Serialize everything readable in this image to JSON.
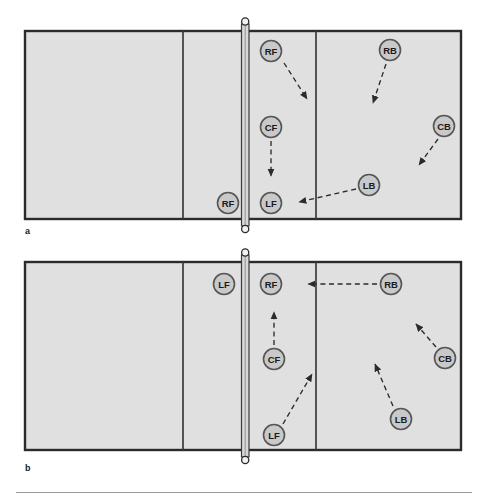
{
  "figure": {
    "title": "",
    "panels": [
      {
        "id": "a",
        "label": "a",
        "label_x": 25,
        "label_y": 226,
        "court": {
          "x": 25,
          "y": 31,
          "w": 436,
          "h": 188
        },
        "attack_lines": [
          183,
          316
        ],
        "net": {
          "x": 245,
          "top": 21,
          "bottom": 229
        },
        "players": [
          {
            "id": "a-rf-left",
            "label": "RF",
            "x": 228,
            "y": 203,
            "side": "left"
          },
          {
            "id": "a-rf-right",
            "label": "RF",
            "x": 271,
            "y": 51,
            "side": "right"
          },
          {
            "id": "a-cf",
            "label": "CF",
            "x": 271,
            "y": 127,
            "side": "right"
          },
          {
            "id": "a-lf",
            "label": "LF",
            "x": 271,
            "y": 203,
            "side": "right"
          },
          {
            "id": "a-rb",
            "label": "RB",
            "x": 390,
            "y": 50,
            "side": "right"
          },
          {
            "id": "a-cb",
            "label": "CB",
            "x": 444,
            "y": 126,
            "side": "right"
          },
          {
            "id": "a-lb",
            "label": "LB",
            "x": 369,
            "y": 185,
            "side": "right"
          }
        ],
        "arrows": [
          {
            "id": "a-arrow-rf",
            "from": "RF",
            "to": "",
            "x1": 284,
            "y1": 63,
            "x2": 309,
            "y2": 101
          },
          {
            "id": "a-arrow-cf",
            "from": "CF",
            "to": "",
            "x1": 271,
            "y1": 141,
            "x2": 271,
            "y2": 177
          },
          {
            "id": "a-arrow-rb",
            "from": "RB",
            "to": "",
            "x1": 386,
            "y1": 64,
            "x2": 372,
            "y2": 105
          },
          {
            "id": "a-arrow-cb",
            "from": "CB",
            "to": "",
            "x1": 438,
            "y1": 139,
            "x2": 417,
            "y2": 167
          },
          {
            "id": "a-arrow-lb",
            "from": "LB",
            "to": "",
            "x1": 356,
            "y1": 189,
            "x2": 297,
            "y2": 202
          }
        ]
      },
      {
        "id": "b",
        "label": "b",
        "label_x": 25,
        "label_y": 470,
        "court": {
          "x": 25,
          "y": 262,
          "w": 436,
          "h": 188
        },
        "attack_lines": [
          183,
          316
        ],
        "net": {
          "x": 245,
          "top": 252,
          "bottom": 460
        },
        "players": [
          {
            "id": "b-lf-left",
            "label": "LF",
            "x": 224,
            "y": 284,
            "side": "left"
          },
          {
            "id": "b-rf",
            "label": "RF",
            "x": 271,
            "y": 284,
            "side": "right"
          },
          {
            "id": "b-cf",
            "label": "CF",
            "x": 274,
            "y": 359,
            "side": "right"
          },
          {
            "id": "b-lf-right",
            "label": "LF",
            "x": 274,
            "y": 435,
            "side": "right"
          },
          {
            "id": "b-rb",
            "label": "RB",
            "x": 391,
            "y": 284,
            "side": "right"
          },
          {
            "id": "b-cb",
            "label": "CB",
            "x": 445,
            "y": 358,
            "side": "right"
          },
          {
            "id": "b-lb",
            "label": "LB",
            "x": 401,
            "y": 419,
            "side": "right"
          }
        ],
        "arrows": [
          {
            "id": "b-arrow-rb",
            "from": "RB",
            "to": "RF",
            "x1": 377,
            "y1": 284,
            "x2": 306,
            "y2": 284
          },
          {
            "id": "b-arrow-cf",
            "from": "CF",
            "to": "RF",
            "x1": 274,
            "y1": 345,
            "x2": 274,
            "y2": 310
          },
          {
            "id": "b-arrow-lf",
            "from": "LF",
            "to": "",
            "x1": 283,
            "y1": 424,
            "x2": 314,
            "y2": 371
          },
          {
            "id": "b-arrow-cb",
            "from": "CB",
            "to": "",
            "x1": 436,
            "y1": 347,
            "x2": 414,
            "y2": 322
          },
          {
            "id": "b-arrow-lb",
            "from": "LB",
            "to": "",
            "x1": 393,
            "y1": 406,
            "x2": 373,
            "y2": 361
          }
        ]
      }
    ]
  },
  "style": {
    "court_fill": "#e0e0e0",
    "court_stroke": "#2b2b2b",
    "line_stroke": "#3a3a3a",
    "player_fill": "#c9c9c9",
    "player_stroke": "#555555",
    "player_text": "#1a1a1a",
    "arrow_color": "#2b2b2b",
    "net_fill": "#d8d8d8",
    "net_stroke": "#3a3a3a",
    "footer_rule": "#9a9a9a"
  }
}
